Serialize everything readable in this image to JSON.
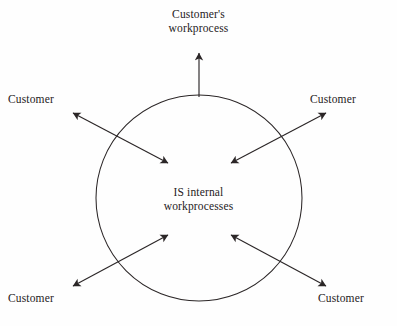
{
  "diagram": {
    "type": "circle-with-bidirectional-arrows",
    "background_color": "#fefefe",
    "stroke_color": "#2b2627",
    "text_color": "#262223",
    "canvas": {
      "width": 397,
      "height": 326
    },
    "circle": {
      "label_line1": "IS internal",
      "label_line2": "workprocesses",
      "center_x": 199,
      "center_y": 198,
      "radius": 103,
      "stroke_width": 1
    },
    "top_node": {
      "label_line1": "Customer's",
      "label_line2": "workprocess"
    },
    "nodes": [
      {
        "id": "customer-top-left",
        "label": "Customer",
        "position": "top-left"
      },
      {
        "id": "customer-top-right",
        "label": "Customer",
        "position": "top-right"
      },
      {
        "id": "customer-bottom-left",
        "label": "Customer",
        "position": "bottom-left"
      },
      {
        "id": "customer-bottom-right",
        "label": "Customer",
        "position": "bottom-right"
      }
    ],
    "connectors": [
      {
        "id": "arrow-up-to-customer-workprocess",
        "from": "circle-top-edge",
        "to": "customers-workprocess",
        "heads": 1,
        "direction": "up",
        "x1": 199,
        "y1": 97,
        "x2": 199,
        "y2": 53
      },
      {
        "id": "arrow-top-left",
        "from": "customer-top-left",
        "to": "circle-interior",
        "heads": 2,
        "direction": "diagonal-nwse",
        "x1": 73,
        "y1": 113,
        "x2": 168,
        "y2": 163
      },
      {
        "id": "arrow-top-right",
        "from": "customer-top-right",
        "to": "circle-interior",
        "heads": 2,
        "direction": "diagonal-nesw",
        "x1": 326,
        "y1": 113,
        "x2": 231,
        "y2": 163
      },
      {
        "id": "arrow-bottom-left",
        "from": "customer-bottom-left",
        "to": "circle-interior",
        "heads": 2,
        "direction": "diagonal-swne",
        "x1": 73,
        "y1": 286,
        "x2": 168,
        "y2": 235
      },
      {
        "id": "arrow-bottom-right",
        "from": "customer-bottom-right",
        "to": "circle-interior",
        "heads": 2,
        "direction": "diagonal-senw",
        "x1": 326,
        "y1": 286,
        "x2": 231,
        "y2": 235
      }
    ]
  }
}
